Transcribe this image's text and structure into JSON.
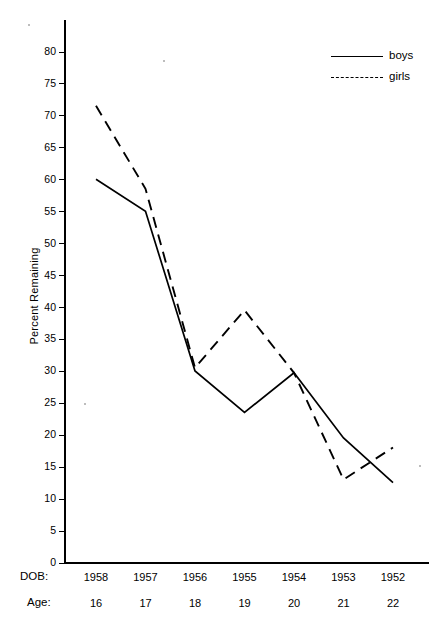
{
  "axis": {
    "y_label": "Percent Remaining",
    "y_ticks": [
      0,
      5,
      10,
      15,
      20,
      25,
      30,
      35,
      40,
      45,
      50,
      55,
      60,
      65,
      70,
      75,
      80
    ],
    "row_titles": {
      "dob": "DOB:",
      "age": "Age:"
    }
  },
  "legend": {
    "items": [
      {
        "label": "boys",
        "style": "solid"
      },
      {
        "label": "girls",
        "style": "dashed"
      }
    ]
  },
  "chart_data": {
    "type": "line",
    "title": "",
    "xlabel": "",
    "ylabel": "Percent Remaining",
    "ylim": [
      0,
      80
    ],
    "ytick_step": 5,
    "grid": false,
    "legend_position": "top-right",
    "categories": [
      "1958",
      "1957",
      "1956",
      "1955",
      "1954",
      "1953",
      "1952"
    ],
    "x_secondary_label": "Age:",
    "x_primary_label": "DOB:",
    "ages": [
      "16",
      "17",
      "18",
      "19",
      "20",
      "21",
      "22"
    ],
    "series": [
      {
        "name": "boys",
        "style": "solid",
        "values": [
          60,
          55,
          30,
          23.5,
          29.7,
          19.5,
          12.5
        ]
      },
      {
        "name": "girls",
        "style": "dashed",
        "values": [
          71.5,
          58.5,
          30.5,
          39.5,
          29.7,
          13,
          18
        ]
      }
    ]
  }
}
